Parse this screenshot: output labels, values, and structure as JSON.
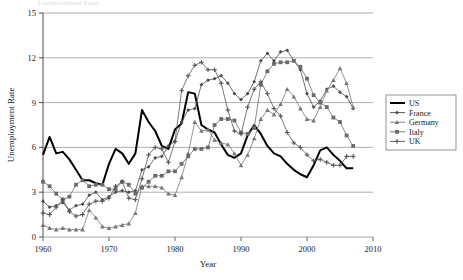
{
  "chart_data": {
    "type": "line",
    "title": "",
    "xlabel": "Year",
    "ylabel": "Unemployment Rate",
    "xlim": [
      1960,
      2010
    ],
    "ylim": [
      0,
      15
    ],
    "xticks": [
      1960,
      1970,
      1980,
      1990,
      2000,
      2010
    ],
    "yticks": [
      0,
      3,
      6,
      9,
      12,
      15
    ],
    "grid": "horizontal",
    "legend_position": "right-outside",
    "x": [
      1960,
      1961,
      1962,
      1963,
      1964,
      1965,
      1966,
      1967,
      1968,
      1969,
      1970,
      1971,
      1972,
      1973,
      1974,
      1975,
      1976,
      1977,
      1978,
      1979,
      1980,
      1981,
      1982,
      1983,
      1984,
      1985,
      1986,
      1987,
      1988,
      1989,
      1990,
      1991,
      1992,
      1993,
      1994,
      1995,
      1996,
      1997,
      1998,
      1999,
      2000,
      2001,
      2002,
      2003,
      2004,
      2005,
      2006,
      2007
    ],
    "series": [
      {
        "name": "US",
        "marker": "none",
        "color": "#000000",
        "width": 2.0,
        "values": [
          5.5,
          6.7,
          5.6,
          5.7,
          5.2,
          4.5,
          3.8,
          3.8,
          3.6,
          3.5,
          4.9,
          5.9,
          5.6,
          4.9,
          5.6,
          8.5,
          7.7,
          7.1,
          6.1,
          5.9,
          7.2,
          7.6,
          9.7,
          9.6,
          7.5,
          7.2,
          7.0,
          6.2,
          5.5,
          5.3,
          5.6,
          6.8,
          7.5,
          6.9,
          6.1,
          5.6,
          5.4,
          4.9,
          4.5,
          4.2,
          4.0,
          4.8,
          5.8,
          6.0,
          5.5,
          5.1,
          4.6,
          4.6
        ]
      },
      {
        "name": "France",
        "marker": "diamond",
        "color": "#4a4a4a",
        "width": 0.8,
        "values": [
          2.4,
          2.0,
          2.1,
          2.3,
          1.8,
          2.1,
          2.2,
          2.8,
          3.0,
          2.5,
          2.7,
          3.0,
          3.1,
          3.0,
          3.1,
          4.5,
          4.7,
          5.3,
          5.4,
          6.1,
          6.4,
          7.7,
          8.5,
          8.6,
          10.2,
          10.5,
          10.6,
          10.8,
          10.3,
          9.6,
          9.2,
          9.6,
          10.4,
          11.8,
          12.3,
          11.8,
          12.4,
          12.5,
          11.8,
          11.2,
          9.6,
          8.7,
          9.1,
          9.9,
          10.1,
          9.7,
          9.4,
          8.6
        ]
      },
      {
        "name": "Germany",
        "marker": "triangle",
        "color": "#777777",
        "width": 0.8,
        "values": [
          0.8,
          0.6,
          0.5,
          0.6,
          0.5,
          0.5,
          0.5,
          1.8,
          1.3,
          0.7,
          0.6,
          0.7,
          0.8,
          0.9,
          1.6,
          3.4,
          3.4,
          3.4,
          3.3,
          2.9,
          2.8,
          4.0,
          5.6,
          7.7,
          7.1,
          7.2,
          6.5,
          6.3,
          6.2,
          5.6,
          4.8,
          5.5,
          6.6,
          7.9,
          8.5,
          8.2,
          8.9,
          9.9,
          9.4,
          8.6,
          7.9,
          7.8,
          8.7,
          9.8,
          10.5,
          11.3,
          10.3,
          8.7
        ]
      },
      {
        "name": "Italy",
        "marker": "square",
        "color": "#6b6b6b",
        "width": 0.8,
        "values": [
          3.7,
          3.4,
          2.9,
          2.5,
          2.7,
          3.5,
          3.8,
          3.4,
          3.5,
          3.5,
          3.2,
          3.2,
          3.7,
          3.5,
          2.9,
          3.3,
          3.7,
          4.1,
          4.1,
          4.4,
          4.4,
          4.9,
          5.4,
          5.9,
          5.9,
          6.0,
          7.5,
          7.9,
          7.9,
          7.8,
          7.0,
          6.9,
          7.3,
          10.2,
          11.1,
          11.6,
          11.7,
          11.7,
          11.8,
          11.4,
          10.6,
          9.5,
          9.0,
          8.7,
          8.0,
          7.7,
          6.8,
          6.1
        ]
      },
      {
        "name": "UK",
        "marker": "plus",
        "color": "#555555",
        "width": 0.8,
        "values": [
          1.6,
          1.5,
          2.0,
          2.5,
          1.7,
          1.4,
          1.5,
          2.2,
          2.4,
          2.4,
          2.6,
          3.4,
          3.7,
          2.6,
          2.5,
          3.9,
          5.5,
          6.0,
          5.9,
          5.0,
          6.4,
          9.8,
          10.8,
          11.5,
          11.7,
          11.2,
          11.2,
          10.3,
          8.5,
          7.1,
          6.9,
          8.7,
          9.9,
          10.4,
          9.6,
          8.6,
          8.1,
          7.0,
          6.3,
          6.0,
          5.5,
          5.1,
          5.2,
          5.0,
          4.8,
          4.8,
          5.4,
          5.4
        ]
      }
    ]
  },
  "legend": {
    "entries": [
      {
        "label": "US"
      },
      {
        "label": "France"
      },
      {
        "label": "Germany"
      },
      {
        "label": "Italy"
      },
      {
        "label": "UK"
      }
    ]
  }
}
